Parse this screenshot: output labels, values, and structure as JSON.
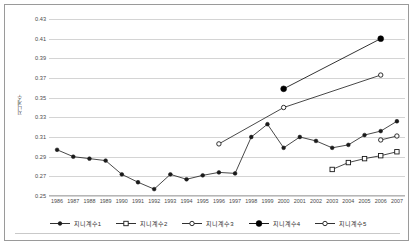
{
  "chart_data": {
    "type": "line",
    "title": "",
    "xlabel": "",
    "ylabel": "지니계수",
    "ylim": [
      0.25,
      0.43
    ],
    "ytick_step": 0.02,
    "yticks": [
      "0.43",
      "0.41",
      "0.39",
      "0.37",
      "0.35",
      "0.33",
      "0.31",
      "0.29",
      "0.27",
      "0.25"
    ],
    "grid": "horizontal",
    "legend_position": "bottom",
    "categories": [
      "1986",
      "1987",
      "1988",
      "1989",
      "1990",
      "1991",
      "1992",
      "1993",
      "1994",
      "1995",
      "1996",
      "1997",
      "1998",
      "1999",
      "2000",
      "2001",
      "2002",
      "2003",
      "2004",
      "2005",
      "2006",
      "2007"
    ],
    "series": [
      {
        "name": "지니계수1",
        "marker": "filled-circle-small",
        "color": "#1a1a1a",
        "values": [
          0.297,
          0.29,
          0.288,
          0.286,
          0.272,
          0.264,
          0.257,
          0.272,
          0.267,
          0.271,
          0.274,
          0.273,
          0.31,
          0.323,
          0.299,
          0.31,
          0.306,
          0.299,
          0.302,
          0.312,
          0.316,
          0.326
        ]
      },
      {
        "name": "지니계수2",
        "marker": "open-square",
        "color": "#1a1a1a",
        "values": [
          null,
          null,
          null,
          null,
          null,
          null,
          null,
          null,
          null,
          null,
          null,
          null,
          null,
          null,
          null,
          null,
          null,
          0.277,
          0.284,
          0.288,
          0.291,
          0.295
        ]
      },
      {
        "name": "지니계수3",
        "marker": "open-circle",
        "color": "#1a1a1a",
        "values": [
          null,
          null,
          null,
          null,
          null,
          null,
          null,
          null,
          null,
          null,
          0.303,
          null,
          null,
          null,
          0.34,
          null,
          null,
          null,
          null,
          null,
          0.373,
          null
        ]
      },
      {
        "name": "지니계수4",
        "marker": "filled-circle-large",
        "color": "#000000",
        "values": [
          null,
          null,
          null,
          null,
          null,
          null,
          null,
          null,
          null,
          null,
          null,
          null,
          null,
          null,
          0.359,
          null,
          null,
          null,
          null,
          null,
          0.41,
          null
        ]
      },
      {
        "name": "지니계수5",
        "marker": "open-circle",
        "color": "#1a1a1a",
        "values": [
          null,
          null,
          null,
          null,
          null,
          null,
          null,
          null,
          null,
          null,
          null,
          null,
          null,
          null,
          null,
          null,
          null,
          null,
          null,
          null,
          0.307,
          0.311
        ]
      }
    ]
  }
}
